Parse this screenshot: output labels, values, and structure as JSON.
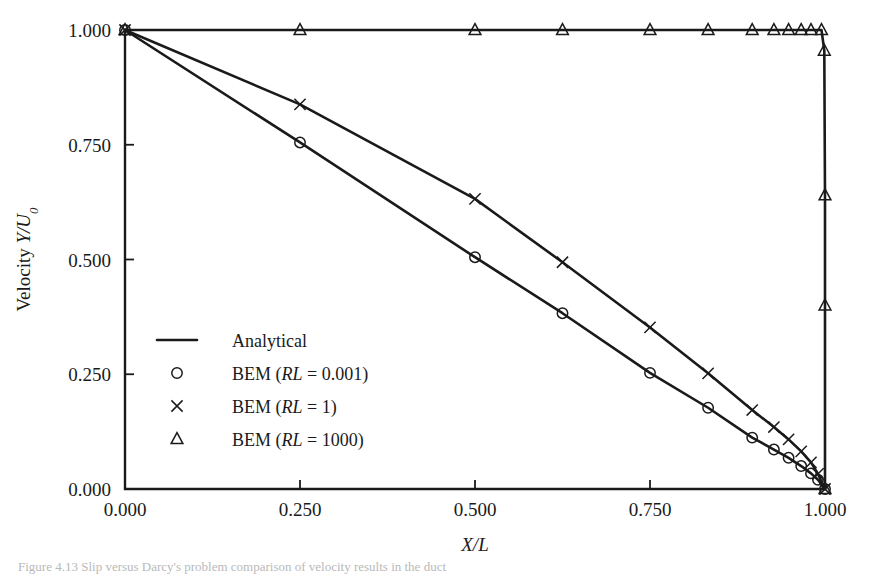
{
  "figure": {
    "caption": "Figure 4.13  Slip versus Darcy's problem comparison of velocity results in the duct"
  },
  "chart_data": {
    "type": "line",
    "title": "",
    "xlabel": "X/L",
    "ylabel": "Velocity Y/U0",
    "ylabel_parts": {
      "prefix": "Velocity ",
      "italic": "Y/U",
      "sub": "0"
    },
    "xlabel_parts": {
      "italic": "X/L"
    },
    "xlim": [
      0.0,
      1.0
    ],
    "ylim": [
      0.0,
      1.0
    ],
    "xticks": [
      0.0,
      0.25,
      0.5,
      0.75,
      1.0
    ],
    "yticks": [
      0.0,
      0.25,
      0.5,
      0.75,
      1.0
    ],
    "xticklabels": [
      "0.000",
      "0.250",
      "0.500",
      "0.750",
      "1.000"
    ],
    "yticklabels": [
      "0.000",
      "0.250",
      "0.500",
      "0.750",
      "1.000"
    ],
    "grid": false,
    "legend_position": "center-left-inside",
    "series": [
      {
        "name": "Analytical",
        "marker": "none",
        "style": "solid-line",
        "legend_label": "Analytical",
        "x": [],
        "y": []
      },
      {
        "name": "BEM (RL = 0.001)",
        "marker": "circle",
        "style": "solid-line-with-markers",
        "legend_label_prefix": "BEM (",
        "legend_label_italic": "RL",
        "legend_label_suffix": " = 0.001)",
        "x": [
          0.0,
          0.25,
          0.5,
          0.625,
          0.75,
          0.833,
          0.896,
          0.927,
          0.948,
          0.966,
          0.98,
          0.99,
          1.0
        ],
        "y": [
          1.0,
          0.755,
          0.505,
          0.383,
          0.253,
          0.177,
          0.112,
          0.086,
          0.068,
          0.05,
          0.034,
          0.02,
          0.0
        ]
      },
      {
        "name": "BEM (RL = 1)",
        "marker": "cross",
        "style": "solid-line-with-markers",
        "legend_label_prefix": "BEM (",
        "legend_label_italic": "RL",
        "legend_label_suffix": " = 1)",
        "x": [
          0.0,
          0.25,
          0.5,
          0.625,
          0.75,
          0.833,
          0.896,
          0.927,
          0.948,
          0.966,
          0.98,
          0.99,
          1.0
        ],
        "y": [
          1.0,
          0.838,
          0.632,
          0.494,
          0.352,
          0.252,
          0.172,
          0.135,
          0.108,
          0.082,
          0.058,
          0.033,
          0.0
        ]
      },
      {
        "name": "BEM (RL = 1000)",
        "marker": "triangle",
        "style": "solid-line-with-markers",
        "legend_label_prefix": "BEM (",
        "legend_label_italic": "RL",
        "legend_label_suffix": " = 1000)",
        "x": [
          0.0,
          0.25,
          0.5,
          0.625,
          0.75,
          0.833,
          0.896,
          0.927,
          0.948,
          0.966,
          0.98,
          0.995,
          0.999,
          1.0,
          1.0,
          1.0
        ],
        "y": [
          1.0,
          1.0,
          1.0,
          1.0,
          1.0,
          1.0,
          1.0,
          1.0,
          1.0,
          1.0,
          1.0,
          1.0,
          0.955,
          0.64,
          0.4,
          0.0
        ]
      }
    ],
    "colors": {
      "ink": "#1a1a1a",
      "background": "#ffffff"
    }
  },
  "legend": {
    "entries": [
      {
        "label": "Analytical",
        "marker": "line"
      },
      {
        "label": "BEM (RL = 0.001)",
        "marker": "circle"
      },
      {
        "label": "BEM (RL = 1)",
        "marker": "cross"
      },
      {
        "label": "BEM (RL = 1000)",
        "marker": "triangle"
      }
    ]
  }
}
